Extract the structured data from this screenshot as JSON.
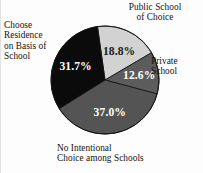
{
  "chart_data": {
    "type": "pie",
    "title": "",
    "subtitle": "",
    "xlabel": "",
    "ylabel": "",
    "legend_position": "callout-labels",
    "grid": false,
    "center": {
      "x": 104,
      "y": 80
    },
    "radius": 54,
    "start_angle_deg": 352,
    "slices": [
      {
        "label": "Public School\nof Choice",
        "value": 18.8,
        "value_label": "18.8%",
        "color": "#d2d2d2",
        "label_color": "#15110f",
        "pct_text_color": "#1a1a1a"
      },
      {
        "label": "Private\nSchool",
        "value": 12.6,
        "value_label": "12.6%",
        "color": "#5c5c5c",
        "label_color": "#15110f",
        "pct_text_color": "#ffffff"
      },
      {
        "label": "No Intentional\nChoice among Schools",
        "value": 37.0,
        "value_label": "37.0%",
        "color": "#545454",
        "label_color": "#15110f",
        "pct_text_color": "#ffffff"
      },
      {
        "label": "Choose\nResidence\non Basis of\nSchool",
        "value": 31.7,
        "value_label": "31.7%",
        "color": "#0b0b0b",
        "label_color": "#15110f",
        "pct_text_color": "#ffffff"
      }
    ]
  },
  "figure": {
    "background_color": "#fdfdfd",
    "outline_color": "#111111"
  },
  "labels": {
    "public_school": "Public School\nof Choice",
    "private_school": "Private\nSchool",
    "no_intentional": "No Intentional\nChoice among Schools",
    "choose_residence": "Choose\nResidence\non Basis of\nSchool"
  },
  "percents": {
    "public_school": "18.8%",
    "private_school": "12.6%",
    "no_intentional": "37.0%",
    "choose_residence": "31.7%"
  }
}
